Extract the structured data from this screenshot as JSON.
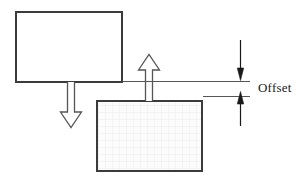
{
  "figure": {
    "type": "engineering-offset-diagram",
    "background_color": "#ffffff",
    "stroke_color": "#3b3b3b",
    "thin_stroke_color": "#555555",
    "hatch_fill_color": "#fbfbfb",
    "hatch_line_color": "#f2f2f2",
    "arrow_fill_color": "#ffffff"
  },
  "labels": {
    "offset": "Offset"
  },
  "shapes": {
    "upper_block": {
      "name": "upper-block",
      "x": 15,
      "y": 11,
      "width": 107,
      "height": 71,
      "fill": "#ffffff",
      "stroke_width": 2
    },
    "lower_block": {
      "name": "lower-block",
      "x": 96,
      "y": 100,
      "width": 107,
      "height": 72,
      "fill": "#fbfbfb",
      "stroke_width": 2
    },
    "down_arrow": {
      "name": "down-arrow",
      "shaft_left": 67,
      "shaft_right": 75,
      "top_y": 82,
      "head_top_y": 112,
      "head_left": 60,
      "head_right": 82,
      "tip_y": 128
    },
    "up_arrow": {
      "name": "up-arrow",
      "shaft_left": 145,
      "shaft_right": 153,
      "bottom_y": 101,
      "head_bottom_y": 70,
      "head_left": 138,
      "head_right": 160,
      "tip_y": 54
    },
    "upper_reference_line": {
      "name": "upper-reference-line",
      "x1": 122,
      "x2": 250,
      "y": 81
    },
    "lower_reference_line": {
      "name": "lower-reference-line",
      "x1": 203,
      "x2": 250,
      "y": 96
    },
    "dimension_top": {
      "name": "dimension-arrow-down",
      "x": 240,
      "y_start": 40,
      "y_tip": 80
    },
    "dimension_bottom": {
      "name": "dimension-arrow-up",
      "x": 240,
      "y_tip": 96,
      "y_end": 126
    },
    "offset_label_position": {
      "left": 258,
      "top": 80
    }
  }
}
